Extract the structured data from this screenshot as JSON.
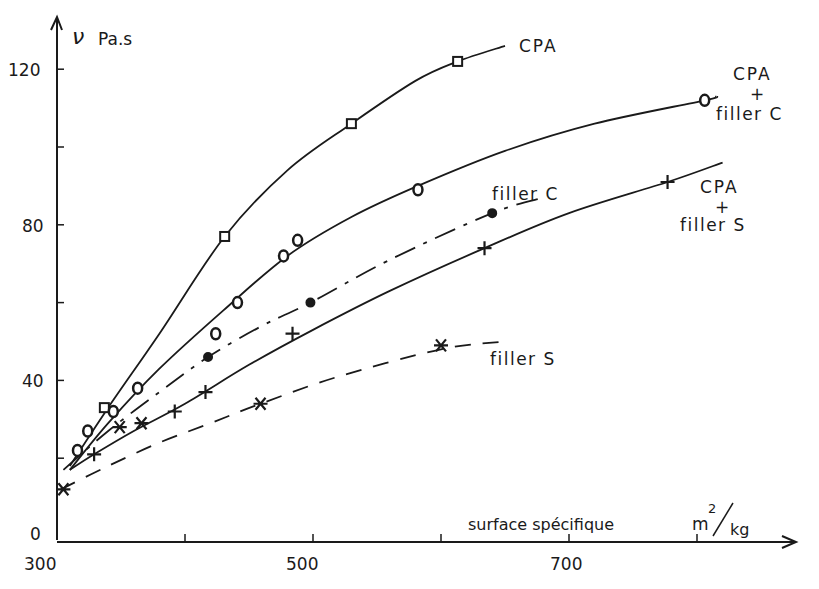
{
  "chart_data": {
    "type": "line",
    "title": "",
    "xlabel": "surface spécifique m²/kg",
    "ylabel": "ν Pa.s",
    "y_symbol": "ν",
    "y_unit": "Pa.s",
    "x_label_text": "surface spécifique",
    "x_unit_num": "m",
    "x_unit_exp": "2",
    "x_unit_den": "kg",
    "xlim": [
      300,
      850
    ],
    "ylim": [
      0,
      130
    ],
    "x_ticks": [
      300,
      400,
      500,
      600,
      700,
      800
    ],
    "x_tick_labels": [
      "300",
      "",
      "500",
      "",
      "700",
      ""
    ],
    "y_ticks": [
      0,
      20,
      40,
      60,
      80,
      100,
      120
    ],
    "y_tick_labels": [
      "0",
      "",
      "40",
      "",
      "80",
      "",
      "120"
    ],
    "grid": false,
    "legend": "inline labels at curve ends",
    "series": [
      {
        "name": "CPA",
        "label_lines": [
          "CPA"
        ],
        "marker": "square",
        "line_style": "solid",
        "points": [
          [
            337,
            33
          ],
          [
            431,
            77
          ],
          [
            530,
            106
          ],
          [
            613,
            122
          ]
        ],
        "curve": [
          [
            310,
            18
          ],
          [
            340,
            33
          ],
          [
            380,
            52
          ],
          [
            431,
            77
          ],
          [
            480,
            94
          ],
          [
            530,
            106
          ],
          [
            580,
            117
          ],
          [
            613,
            122
          ],
          [
            650,
            126
          ]
        ]
      },
      {
        "name": "CPA + filler C",
        "label_lines": [
          "CPA",
          "+",
          "filler C"
        ],
        "marker": "circle",
        "line_style": "solid",
        "points": [
          [
            316,
            22
          ],
          [
            324,
            27
          ],
          [
            344,
            32
          ],
          [
            363,
            38
          ],
          [
            424,
            52
          ],
          [
            441,
            60
          ],
          [
            477,
            72
          ],
          [
            488,
            76
          ],
          [
            582,
            89
          ],
          [
            806,
            112
          ]
        ],
        "curve": [
          [
            310,
            17
          ],
          [
            340,
            29
          ],
          [
            380,
            43
          ],
          [
            430,
            58
          ],
          [
            480,
            72
          ],
          [
            530,
            82
          ],
          [
            582,
            90
          ],
          [
            650,
            99
          ],
          [
            720,
            106
          ],
          [
            806,
            112
          ],
          [
            815,
            113
          ]
        ]
      },
      {
        "name": "filler C",
        "label_lines": [
          "filler C"
        ],
        "marker": "dot",
        "line_style": "dash-dot",
        "points": [
          [
            418,
            46
          ],
          [
            498,
            60
          ],
          [
            640,
            83
          ]
        ],
        "curve": [
          [
            305,
            17
          ],
          [
            340,
            27
          ],
          [
            380,
            37
          ],
          [
            418,
            46
          ],
          [
            460,
            54
          ],
          [
            498,
            60
          ],
          [
            560,
            71
          ],
          [
            640,
            83
          ],
          [
            680,
            87
          ]
        ]
      },
      {
        "name": "CPA + filler S",
        "label_lines": [
          "CPA",
          "+",
          "filler S"
        ],
        "marker": "plus",
        "line_style": "solid",
        "points": [
          [
            329,
            21
          ],
          [
            392,
            32
          ],
          [
            416,
            37
          ],
          [
            484,
            52
          ],
          [
            634,
            74
          ],
          [
            777,
            91
          ]
        ],
        "curve": [
          [
            310,
            17
          ],
          [
            329,
            21
          ],
          [
            360,
            27
          ],
          [
            400,
            34
          ],
          [
            450,
            44
          ],
          [
            500,
            53
          ],
          [
            560,
            63
          ],
          [
            634,
            74
          ],
          [
            700,
            83
          ],
          [
            777,
            91
          ],
          [
            820,
            96
          ]
        ]
      },
      {
        "name": "filler S",
        "label_lines": [
          "filler S"
        ],
        "marker": "asterisk",
        "line_style": "dashed",
        "points": [
          [
            305,
            12
          ],
          [
            349,
            28
          ],
          [
            366,
            29
          ],
          [
            459,
            34
          ],
          [
            600,
            49
          ]
        ],
        "curve": [
          [
            303,
            12
          ],
          [
            340,
            18
          ],
          [
            380,
            24
          ],
          [
            420,
            29
          ],
          [
            459,
            34
          ],
          [
            520,
            41
          ],
          [
            600,
            48
          ],
          [
            650,
            50
          ]
        ]
      }
    ]
  },
  "labels": {
    "y_num_120": "120",
    "y_num_80": "80",
    "y_num_40": "40",
    "y_num_0": "0",
    "x_num_300": "300",
    "x_num_500": "500",
    "x_num_700": "700",
    "cpa": "CPA",
    "cpa_fc_1": "CPA",
    "cpa_fc_2": "+",
    "cpa_fc_3": "filler C",
    "filler_c": "filler C",
    "cpa_fs_1": "CPA",
    "cpa_fs_2": "+",
    "cpa_fs_3": "filler S",
    "filler_s": "filler S"
  },
  "colors": {
    "ink": "#1a1a1a",
    "background": "#ffffff"
  }
}
